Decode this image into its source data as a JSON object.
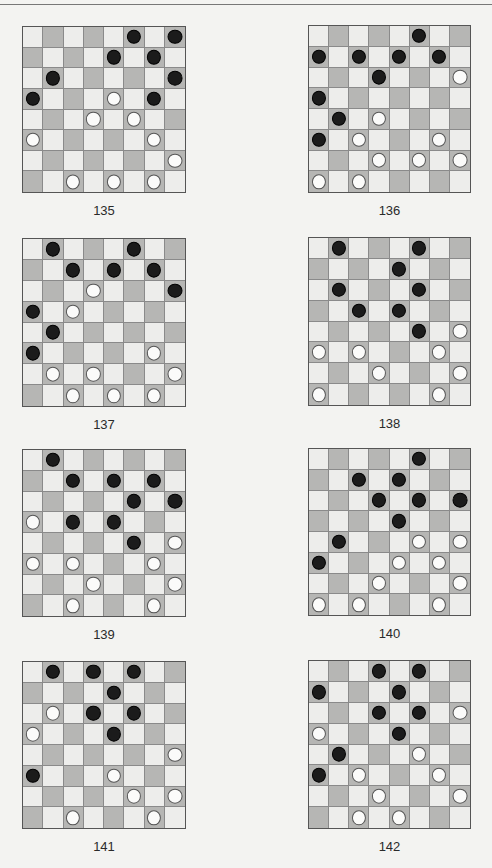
{
  "page": {
    "header_rule": true
  },
  "colors": {
    "light_square": "#ededeb",
    "dark_square": "#b6b6b4",
    "black_piece": "#1b1b1b",
    "white_piece": "#fbfbfa",
    "grid_line": "#555555"
  },
  "boards": [
    {
      "label": "135",
      "x": 22,
      "y": 26,
      "w": 164,
      "h": 167,
      "black": [
        [
          0,
          5
        ],
        [
          0,
          7
        ],
        [
          1,
          4
        ],
        [
          1,
          6
        ],
        [
          2,
          1
        ],
        [
          2,
          7
        ],
        [
          3,
          0
        ],
        [
          3,
          6
        ]
      ],
      "white": [
        [
          3,
          4
        ],
        [
          4,
          3
        ],
        [
          4,
          5
        ],
        [
          5,
          0
        ],
        [
          5,
          6
        ],
        [
          6,
          7
        ],
        [
          7,
          2
        ],
        [
          7,
          4
        ],
        [
          7,
          6
        ]
      ]
    },
    {
      "label": "136",
      "x": 308,
      "y": 25,
      "w": 163,
      "h": 168,
      "black": [
        [
          0,
          5
        ],
        [
          1,
          0
        ],
        [
          1,
          2
        ],
        [
          1,
          4
        ],
        [
          1,
          6
        ],
        [
          2,
          3
        ],
        [
          3,
          0
        ],
        [
          4,
          1
        ],
        [
          5,
          0
        ]
      ],
      "white": [
        [
          2,
          7
        ],
        [
          4,
          3
        ],
        [
          5,
          2
        ],
        [
          5,
          6
        ],
        [
          6,
          3
        ],
        [
          6,
          5
        ],
        [
          6,
          7
        ],
        [
          7,
          0
        ],
        [
          7,
          2
        ]
      ]
    },
    {
      "label": "137",
      "x": 22,
      "y": 238,
      "w": 164,
      "h": 169,
      "black": [
        [
          0,
          1
        ],
        [
          0,
          5
        ],
        [
          1,
          2
        ],
        [
          1,
          4
        ],
        [
          1,
          6
        ],
        [
          2,
          7
        ],
        [
          3,
          0
        ],
        [
          4,
          1
        ],
        [
          5,
          0
        ]
      ],
      "white": [
        [
          2,
          3
        ],
        [
          3,
          2
        ],
        [
          5,
          6
        ],
        [
          6,
          1
        ],
        [
          6,
          3
        ],
        [
          6,
          7
        ],
        [
          7,
          2
        ],
        [
          7,
          4
        ],
        [
          7,
          6
        ]
      ]
    },
    {
      "label": "138",
      "x": 308,
      "y": 237,
      "w": 163,
      "h": 169,
      "black": [
        [
          0,
          1
        ],
        [
          0,
          5
        ],
        [
          1,
          4
        ],
        [
          2,
          1
        ],
        [
          2,
          5
        ],
        [
          3,
          2
        ],
        [
          3,
          4
        ],
        [
          4,
          5
        ]
      ],
      "white": [
        [
          4,
          7
        ],
        [
          5,
          0
        ],
        [
          5,
          2
        ],
        [
          5,
          6
        ],
        [
          6,
          3
        ],
        [
          6,
          7
        ],
        [
          7,
          0
        ],
        [
          7,
          6
        ]
      ]
    },
    {
      "label": "139",
      "x": 22,
      "y": 449,
      "w": 164,
      "h": 168,
      "black": [
        [
          0,
          1
        ],
        [
          1,
          2
        ],
        [
          1,
          4
        ],
        [
          1,
          6
        ],
        [
          2,
          5
        ],
        [
          2,
          7
        ],
        [
          3,
          2
        ],
        [
          3,
          4
        ],
        [
          4,
          5
        ]
      ],
      "white": [
        [
          3,
          0
        ],
        [
          4,
          7
        ],
        [
          5,
          0
        ],
        [
          5,
          2
        ],
        [
          5,
          6
        ],
        [
          6,
          3
        ],
        [
          6,
          7
        ],
        [
          7,
          2
        ],
        [
          7,
          6
        ]
      ]
    },
    {
      "label": "140",
      "x": 308,
      "y": 448,
      "w": 163,
      "h": 168,
      "black": [
        [
          0,
          5
        ],
        [
          1,
          2
        ],
        [
          1,
          4
        ],
        [
          2,
          3
        ],
        [
          2,
          5
        ],
        [
          2,
          7
        ],
        [
          3,
          4
        ],
        [
          4,
          1
        ],
        [
          5,
          0
        ]
      ],
      "white": [
        [
          4,
          5
        ],
        [
          4,
          7
        ],
        [
          5,
          4
        ],
        [
          5,
          6
        ],
        [
          6,
          3
        ],
        [
          6,
          7
        ],
        [
          7,
          0
        ],
        [
          7,
          2
        ],
        [
          7,
          6
        ]
      ]
    },
    {
      "label": "141",
      "x": 22,
      "y": 661,
      "w": 164,
      "h": 168,
      "black": [
        [
          0,
          1
        ],
        [
          0,
          3
        ],
        [
          0,
          5
        ],
        [
          1,
          4
        ],
        [
          2,
          3
        ],
        [
          2,
          5
        ],
        [
          3,
          4
        ],
        [
          5,
          0
        ]
      ],
      "white": [
        [
          2,
          1
        ],
        [
          3,
          0
        ],
        [
          4,
          7
        ],
        [
          5,
          4
        ],
        [
          6,
          5
        ],
        [
          6,
          7
        ],
        [
          7,
          2
        ],
        [
          7,
          6
        ]
      ]
    },
    {
      "label": "142",
      "x": 308,
      "y": 660,
      "w": 163,
      "h": 169,
      "black": [
        [
          0,
          3
        ],
        [
          0,
          5
        ],
        [
          1,
          0
        ],
        [
          1,
          4
        ],
        [
          2,
          3
        ],
        [
          2,
          5
        ],
        [
          3,
          4
        ],
        [
          4,
          1
        ],
        [
          5,
          0
        ]
      ],
      "white": [
        [
          2,
          7
        ],
        [
          3,
          0
        ],
        [
          4,
          5
        ],
        [
          5,
          2
        ],
        [
          5,
          6
        ],
        [
          6,
          3
        ],
        [
          6,
          7
        ],
        [
          7,
          2
        ],
        [
          7,
          4
        ]
      ]
    }
  ]
}
